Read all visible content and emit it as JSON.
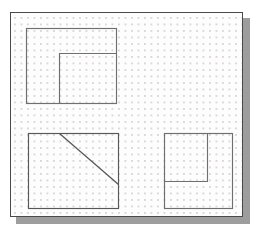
{
  "canvas": {
    "name": "drafting-canvas",
    "background_color": "#fdfdfd",
    "border_color": "#4a4a4a",
    "shadow_color": "#9d9d9d",
    "width": 233,
    "height": 205,
    "grid": {
      "name": "dot-grid",
      "type": "dotted",
      "dot_color": "#dbd6d9",
      "spacing": 6.5,
      "visible": true
    }
  },
  "shapes": [
    {
      "name": "shape-top-left",
      "label": "L-shaped figure (outer rectangle with inner rectangle notch at lower right)",
      "type": "rect-with-inner-rect",
      "stroke_color": "#6f6f72",
      "outer": {
        "x": 15,
        "y": 15,
        "width": 90,
        "height": 75
      },
      "inner": {
        "x": 48,
        "y": 40,
        "width": 57,
        "height": 50
      }
    },
    {
      "name": "shape-bottom-left",
      "label": "Rectangle with diagonal line",
      "type": "rect-with-diagonal",
      "stroke_color": "#58585b",
      "outer": {
        "x": 17,
        "y": 120,
        "width": 90,
        "height": 75
      },
      "diagonal": {
        "x1": 48,
        "y1": 120,
        "x2": 107,
        "y2": 171
      }
    },
    {
      "name": "shape-bottom-right",
      "label": "Rectangle with inner rectangle at upper left",
      "type": "rect-with-inner-rect",
      "stroke_color": "#6f6f72",
      "outer": {
        "x": 153,
        "y": 120,
        "width": 68,
        "height": 75
      },
      "inner": {
        "x": 153,
        "y": 120,
        "width": 43,
        "height": 48
      }
    }
  ]
}
